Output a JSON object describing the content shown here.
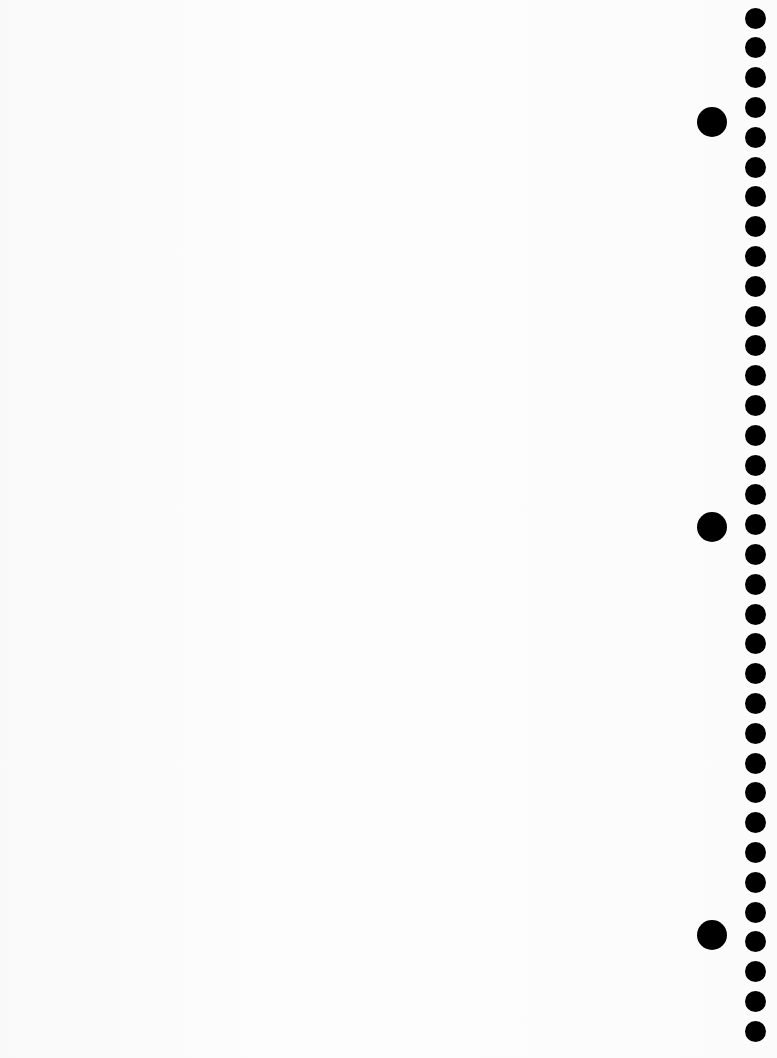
{
  "page": {
    "background_color": "#fbfbfb",
    "hole_color": "#000000"
  },
  "holes": {
    "small": {
      "count": 35,
      "x_center": 755,
      "first_y_center": 18,
      "pitch": 29.8,
      "diameter": 21
    },
    "large": {
      "x_center": 712,
      "y_centers": [
        122,
        527,
        935
      ],
      "diameter": 30
    }
  }
}
